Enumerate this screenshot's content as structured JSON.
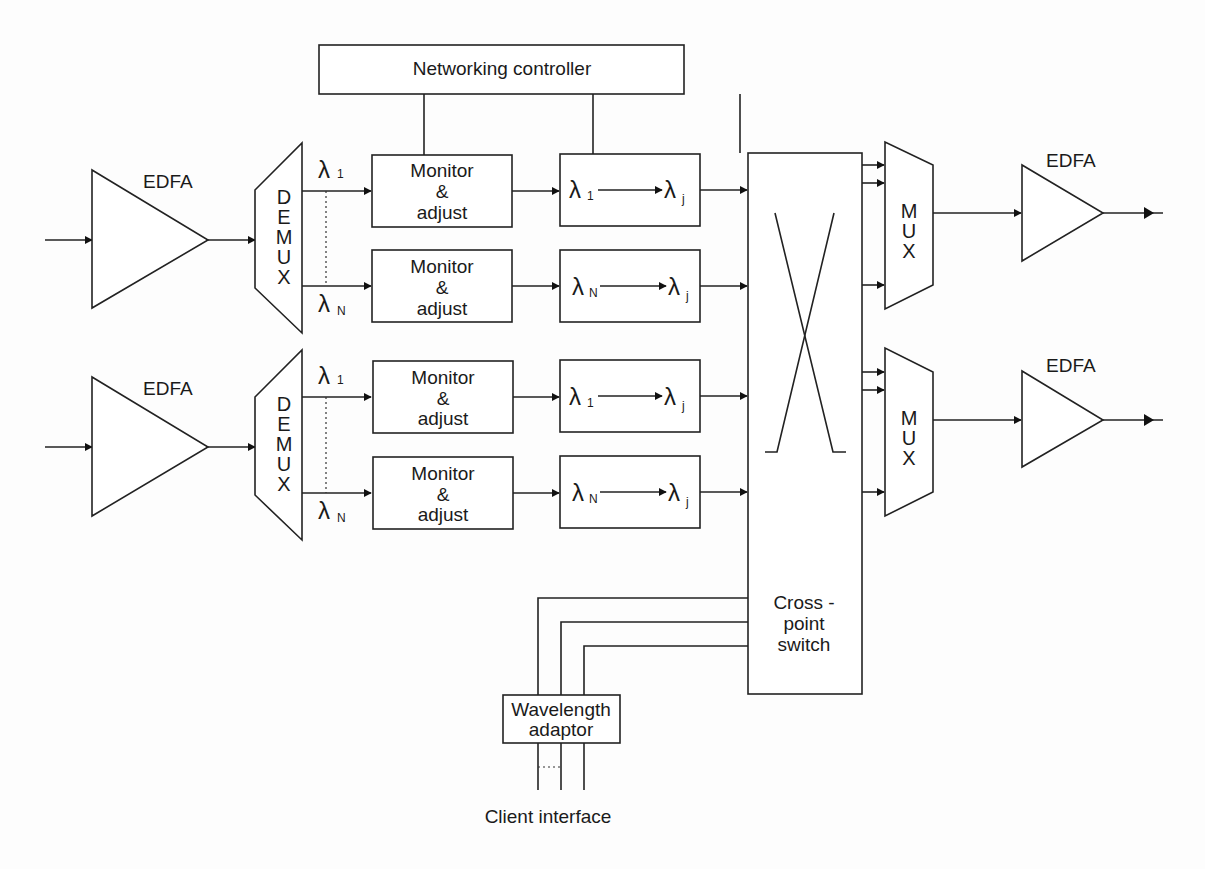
{
  "controller": {
    "label": "Networking controller"
  },
  "edfa_label": "EDFA",
  "demux_letters": [
    "D",
    "E",
    "M",
    "U",
    "X"
  ],
  "mux_letters": [
    "M",
    "U",
    "X"
  ],
  "monitor": {
    "line1": "Monitor",
    "line2": "&",
    "line3": "adjust"
  },
  "lambda": {
    "symbol": "λ",
    "sub1": "1",
    "subN": "N",
    "subj": "j"
  },
  "switch": {
    "line1": "Cross -",
    "line2": "point",
    "line3": "switch"
  },
  "adaptor": {
    "line1": "Wavelength",
    "line2": "adaptor"
  },
  "client": {
    "label": "Client interface"
  },
  "colors": {
    "line": "#222222",
    "background": "#fdfdfd"
  }
}
